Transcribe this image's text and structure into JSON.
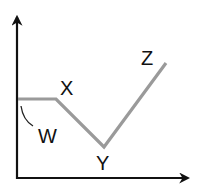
{
  "diagram": {
    "labels": {
      "w": "W",
      "x": "X",
      "y": "Y",
      "z": "Z"
    },
    "colors": {
      "axis": "#111111",
      "path": "#9a9a9a",
      "text": "#111111"
    },
    "points": {
      "start": [
        18,
        99
      ],
      "X": [
        56,
        99
      ],
      "Y": [
        104,
        147
      ],
      "Z": [
        166,
        63
      ]
    }
  }
}
